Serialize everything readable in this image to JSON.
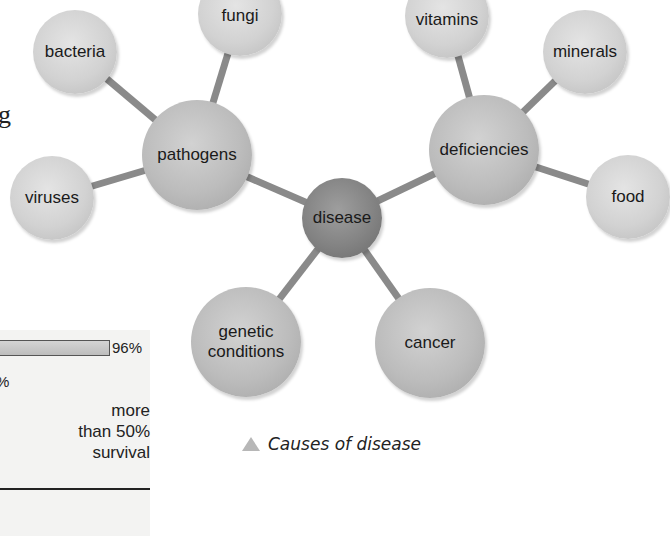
{
  "diagram": {
    "title": "Causes of disease",
    "center": {
      "id": "disease",
      "label": "disease"
    },
    "nodes": [
      {
        "id": "bacteria",
        "label": "bacteria",
        "parent": "pathogens"
      },
      {
        "id": "fungi",
        "label": "fungi",
        "parent": "pathogens"
      },
      {
        "id": "viruses",
        "label": "viruses",
        "parent": "pathogens"
      },
      {
        "id": "pathogens",
        "label": "pathogens",
        "parent": "disease"
      },
      {
        "id": "vitamins",
        "label": "vitamins",
        "parent": "deficiencies"
      },
      {
        "id": "minerals",
        "label": "minerals",
        "parent": "deficiencies"
      },
      {
        "id": "food",
        "label": "food",
        "parent": "deficiencies"
      },
      {
        "id": "deficiencies",
        "label": "deficiencies",
        "parent": "disease"
      },
      {
        "id": "genetic_conditions",
        "label_line1": "genetic",
        "label_line2": "conditions",
        "parent": "disease"
      },
      {
        "id": "cancer",
        "label": "cancer",
        "parent": "disease"
      }
    ],
    "caption": "Causes of disease",
    "caption_icon": "triangle-icon"
  },
  "side_panel": {
    "bar_value_label": "96%",
    "partial_pct_label": "%",
    "survival_line1": "more",
    "survival_line2": "than 50%",
    "survival_line3": "survival"
  },
  "edge_fragments": {
    "frag1": "g"
  },
  "colors": {
    "link": "#8a8a8a",
    "node_light": "#d2d2d2",
    "node_mid": "#bcbcbc",
    "node_core": "#838383",
    "panel_bg": "#f3f3f2"
  }
}
